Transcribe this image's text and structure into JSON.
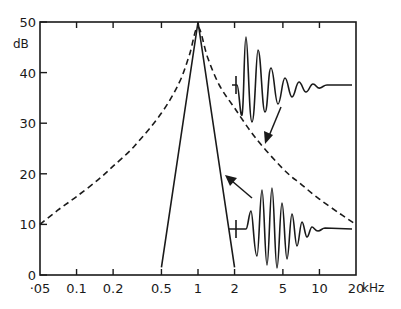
{
  "chart_data": {
    "type": "line",
    "title": "",
    "xlabel": "kHz",
    "ylabel": "dB",
    "x_scale": "log",
    "xlim": [
      0.05,
      20
    ],
    "ylim": [
      0,
      50
    ],
    "grid": false,
    "legend": null,
    "x_ticks": [
      0.05,
      0.1,
      0.2,
      0.5,
      1,
      2,
      5,
      10,
      20
    ],
    "x_tick_labels": [
      "·05",
      "0.1",
      "0.2",
      "0.5",
      "1",
      "2",
      "5",
      "10",
      "20"
    ],
    "x_unit_label": "kHz",
    "y_ticks": [
      0,
      10,
      20,
      30,
      40,
      50
    ],
    "y_tick_labels": [
      "0",
      "10",
      "20",
      "30",
      "40",
      "50"
    ],
    "y_unit_label": "dB",
    "series": [
      {
        "name": "broad filter response",
        "style": "dashed",
        "x": [
          0.05,
          0.07,
          0.1,
          0.15,
          0.2,
          0.3,
          0.5,
          0.7,
          0.85,
          1.0,
          1.2,
          1.5,
          2,
          3,
          5,
          7,
          10,
          15,
          20
        ],
        "y": [
          10,
          12.8,
          15.5,
          18.8,
          21.5,
          25.5,
          32,
          38,
          43.5,
          49,
          43,
          37.5,
          33,
          27,
          21,
          18,
          15,
          12,
          10
        ]
      },
      {
        "name": "narrow filter response",
        "style": "solid",
        "x": [
          0.5,
          1.0,
          2.0
        ],
        "y": [
          1.5,
          50,
          1.5
        ]
      }
    ],
    "annotations": [
      {
        "type": "waveform",
        "name": "impulse response of broad filter (fast decay)",
        "position": "upper right",
        "arrow_to": "dashed curve"
      },
      {
        "type": "waveform",
        "name": "impulse response of narrow filter (long ringing)",
        "position": "lower right",
        "arrow_to": "solid curve"
      }
    ]
  }
}
